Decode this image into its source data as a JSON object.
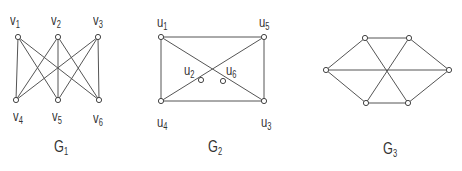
{
  "graphs": [
    {
      "name": "G",
      "sub": "1",
      "title_pos": [
        54,
        138
      ],
      "nodes": [
        {
          "id": "v1",
          "label": "v",
          "sub": "1",
          "x": 18,
          "y": 37,
          "lx": 10,
          "ly": 12
        },
        {
          "id": "v2",
          "label": "v",
          "sub": "2",
          "x": 58,
          "y": 37,
          "lx": 51,
          "ly": 12
        },
        {
          "id": "v3",
          "label": "v",
          "sub": "3",
          "x": 98,
          "y": 37,
          "lx": 93,
          "ly": 12
        },
        {
          "id": "v4",
          "label": "v",
          "sub": "4",
          "x": 16,
          "y": 100,
          "lx": 13,
          "ly": 108
        },
        {
          "id": "v5",
          "label": "v",
          "sub": "5",
          "x": 58,
          "y": 100,
          "lx": 52,
          "ly": 108
        },
        {
          "id": "v6",
          "label": "v",
          "sub": "6",
          "x": 99,
          "y": 100,
          "lx": 93,
          "ly": 110
        }
      ],
      "edges": [
        [
          "v1",
          "v4"
        ],
        [
          "v1",
          "v5"
        ],
        [
          "v1",
          "v6"
        ],
        [
          "v2",
          "v4"
        ],
        [
          "v2",
          "v5"
        ],
        [
          "v2",
          "v6"
        ],
        [
          "v3",
          "v4"
        ],
        [
          "v3",
          "v5"
        ],
        [
          "v3",
          "v6"
        ]
      ]
    },
    {
      "name": "G",
      "sub": "2",
      "title_pos": [
        208,
        138
      ],
      "nodes": [
        {
          "id": "u1",
          "label": "u",
          "sub": "1",
          "x": 161,
          "y": 37,
          "lx": 157,
          "ly": 14
        },
        {
          "id": "u5",
          "label": "u",
          "sub": "5",
          "x": 264,
          "y": 37,
          "lx": 259,
          "ly": 14
        },
        {
          "id": "u2",
          "label": "u",
          "sub": "2",
          "x": 201,
          "y": 80,
          "lx": 184,
          "ly": 62
        },
        {
          "id": "u6",
          "label": "u",
          "sub": "6",
          "x": 223,
          "y": 81,
          "lx": 226,
          "ly": 62
        },
        {
          "id": "u4",
          "label": "u",
          "sub": "4",
          "x": 161,
          "y": 101,
          "lx": 157,
          "ly": 114
        },
        {
          "id": "u3",
          "label": "u",
          "sub": "3",
          "x": 264,
          "y": 101,
          "lx": 261,
          "ly": 114
        }
      ],
      "edges": [
        [
          "u1",
          "u5"
        ],
        [
          "u1",
          "u4"
        ],
        [
          "u5",
          "u3"
        ],
        [
          "u4",
          "u3"
        ],
        [
          "u1",
          "u3"
        ],
        [
          "u4",
          "u5"
        ]
      ]
    },
    {
      "name": "G",
      "sub": "3",
      "title_pos": [
        383,
        140
      ],
      "nodes": [
        {
          "id": "a",
          "x": 326,
          "y": 70
        },
        {
          "id": "b",
          "x": 365,
          "y": 38
        },
        {
          "id": "c",
          "x": 409,
          "y": 38
        },
        {
          "id": "d",
          "x": 449,
          "y": 70
        },
        {
          "id": "e",
          "x": 366,
          "y": 103
        },
        {
          "id": "f",
          "x": 408,
          "y": 103
        }
      ],
      "edges": [
        [
          "a",
          "b"
        ],
        [
          "b",
          "c"
        ],
        [
          "c",
          "d"
        ],
        [
          "d",
          "f"
        ],
        [
          "f",
          "e"
        ],
        [
          "e",
          "a"
        ],
        [
          "a",
          "d"
        ],
        [
          "b",
          "f"
        ],
        [
          "c",
          "e"
        ]
      ]
    }
  ]
}
